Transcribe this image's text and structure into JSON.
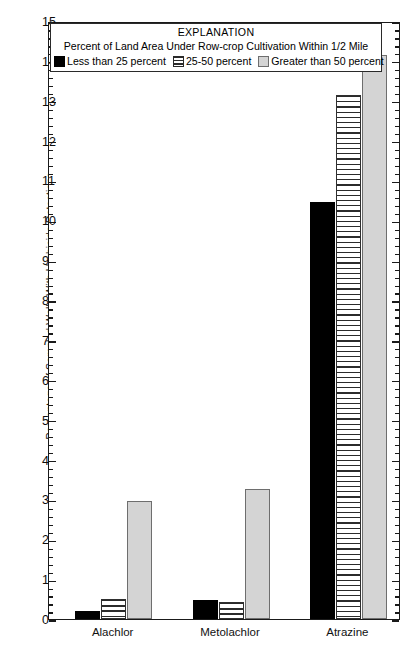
{
  "chart_data": {
    "type": "bar",
    "title": "",
    "xlabel": "",
    "ylabel": "Percentage of Sampled Wells With Herbicide Detections",
    "ylim": [
      0,
      15
    ],
    "ytick_step": 1,
    "yminor_step": 0.2,
    "yticks": [
      0,
      1,
      2,
      3,
      4,
      5,
      6,
      7,
      8,
      9,
      10,
      11,
      12,
      13,
      14,
      15
    ],
    "grid": false,
    "legend_position": "top-inside",
    "categories": [
      "Alachlor",
      "Metolachlor",
      "Atrazine"
    ],
    "series": [
      {
        "name": "Less than 25 percent",
        "color": "#000000",
        "pattern": "solid-black",
        "values": [
          0.2,
          0.47,
          10.45
        ]
      },
      {
        "name": "25-50 percent",
        "color": "#ffffff",
        "pattern": "horizontal-lines",
        "values": [
          0.5,
          0.43,
          13.15
        ]
      },
      {
        "name": "Greater than 50 percent",
        "color": "#d4d4d4",
        "pattern": "solid-gray",
        "values": [
          2.95,
          3.25,
          14.15
        ]
      }
    ],
    "annotations": {
      "legend_title": "EXPLANATION",
      "legend_subtitle": "Percent of Land Area Under Row-crop Cultivation Within 1/2 Mile"
    }
  },
  "legend": {
    "title": "EXPLANATION",
    "subtitle": "Percent of Land Area Under Row-crop Cultivation Within 1/2 Mile",
    "items": [
      {
        "label": "Less than 25 percent"
      },
      {
        "label": "25-50 percent"
      },
      {
        "label": "Greater than 50 percent"
      }
    ]
  },
  "axis": {
    "y_title": "Percentage of Sampled Wells With Herbicide Detections"
  }
}
